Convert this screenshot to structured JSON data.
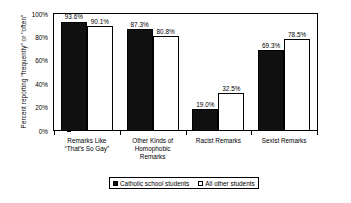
{
  "chart_data": {
    "type": "bar",
    "title": "",
    "xlabel": "",
    "ylabel": "Percent reporting \"frequently\" or \"often\"",
    "ylim": [
      0,
      100
    ],
    "grid": false,
    "legend_position": "bottom",
    "categories": [
      "Remarks Like\n“That’s So Gay”",
      "Other Kinds of\nHomophobic\nRemarks",
      "Racist Remarks",
      "Sexist Remarks"
    ],
    "series": [
      {
        "name": "Catholic school students",
        "color": "#111111",
        "values": [
          93.6,
          87.3,
          19.0,
          69.3
        ],
        "labels": [
          "93.6%",
          "87.3%",
          "19.0%",
          "69.3%"
        ]
      },
      {
        "name": "All other students",
        "color": "#ffffff",
        "values": [
          90.1,
          80.8,
          32.5,
          78.5
        ],
        "labels": [
          "90.1%",
          "80.8%",
          "32.5%",
          "78.5%"
        ]
      }
    ],
    "y_ticks": [
      {
        "value": 100,
        "label": "100%"
      },
      {
        "value": 80,
        "label": "80%"
      },
      {
        "value": 60,
        "label": "60%"
      },
      {
        "value": 40,
        "label": "40%"
      },
      {
        "value": 20,
        "label": "20%"
      },
      {
        "value": 0,
        "label": "0%"
      }
    ]
  },
  "legend": {
    "items": [
      {
        "label": "Catholic school students",
        "swatch": "dark"
      },
      {
        "label": "All other students",
        "swatch": "light"
      }
    ]
  }
}
